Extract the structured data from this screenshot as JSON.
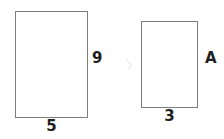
{
  "figure": {
    "background_color": "#ffffff",
    "stroke_color": "#7c7c7c",
    "text_color": "#231f20",
    "canvas": {
      "width": 224,
      "height": 139
    }
  },
  "shapes": [
    {
      "name": "left-rectangle",
      "role": "larger-rectangle",
      "x": 15,
      "y": 11,
      "width": 73,
      "height": 107,
      "labels": {
        "width": "5",
        "height": "9"
      }
    },
    {
      "name": "right-rectangle",
      "role": "smaller-rectangle",
      "x": 141,
      "y": 21,
      "width": 57,
      "height": 87,
      "labels": {
        "width": "3",
        "height": "A"
      }
    }
  ],
  "labels": {
    "left_height": "9",
    "left_width": "5",
    "right_height": "A",
    "right_width": "3"
  },
  "artifact": {
    "name": "faint-gray-mark",
    "color": "#dcdcdc"
  }
}
